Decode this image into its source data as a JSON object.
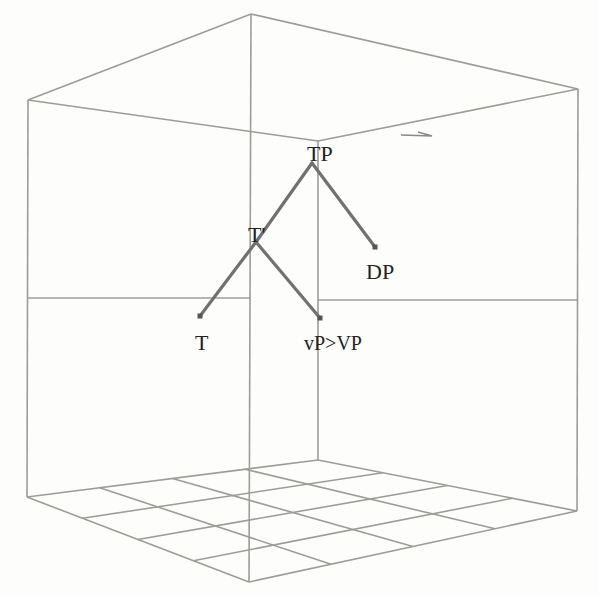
{
  "diagram": {
    "type": "3d-syntax-tree-in-box",
    "colors": {
      "background": "#fdfdfb",
      "box_edges": "#9c9c98",
      "branches": "#717171",
      "labels": "#222222"
    },
    "box": {
      "top_face": [
        [
          28,
          100
        ],
        [
          251,
          14
        ],
        [
          578,
          89
        ],
        [
          318,
          141
        ]
      ],
      "floor": {
        "left": [
          27,
          497
        ],
        "front": [
          249,
          582
        ],
        "right": [
          577,
          511
        ],
        "back": [
          318,
          460
        ],
        "grid_divisions": 4
      }
    },
    "tree": {
      "nodes": [
        {
          "id": "tp",
          "label": "TP",
          "x": 312,
          "y": 163,
          "label_x": 307,
          "label_y": 161
        },
        {
          "id": "tbar",
          "label": "T'",
          "x": 256,
          "y": 242,
          "label_x": 248,
          "label_y": 242
        },
        {
          "id": "dp",
          "label": "DP",
          "x": 375,
          "y": 247,
          "label_x": 366,
          "label_y": 279
        },
        {
          "id": "t",
          "label": "T",
          "x": 200,
          "y": 316,
          "label_x": 195,
          "label_y": 350
        },
        {
          "id": "vp",
          "label": "vP>VP",
          "x": 320,
          "y": 318,
          "label_x": 304,
          "label_y": 350
        }
      ],
      "edges": [
        [
          "tp",
          "tbar"
        ],
        [
          "tp",
          "dp"
        ],
        [
          "tbar",
          "t"
        ],
        [
          "tbar",
          "vp"
        ]
      ]
    }
  }
}
